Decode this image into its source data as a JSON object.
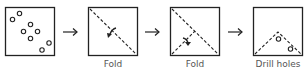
{
  "diagram": {
    "steps": [
      {
        "id": "paper",
        "label": ""
      },
      {
        "id": "fold1",
        "label": "Fold"
      },
      {
        "id": "fold2",
        "label": "Fold"
      },
      {
        "id": "drill",
        "label": "Drill holes"
      }
    ],
    "arrow_symbol": "→",
    "stroke_color": "#222222",
    "label_color": "#555555"
  }
}
